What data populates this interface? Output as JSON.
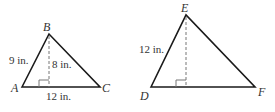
{
  "figure": {
    "triangle_abc": {
      "vertices": {
        "A": "A",
        "B": "B",
        "C": "C"
      },
      "side_ab": "9 in.",
      "height": "8 in.",
      "base_ac": "12 in."
    },
    "triangle_def": {
      "vertices": {
        "D": "D",
        "E": "E",
        "F": "F"
      },
      "side_de": "12 in."
    }
  },
  "colors": {
    "stroke": "#1a1a1a",
    "dashed": "#777777",
    "text": "#333333"
  }
}
